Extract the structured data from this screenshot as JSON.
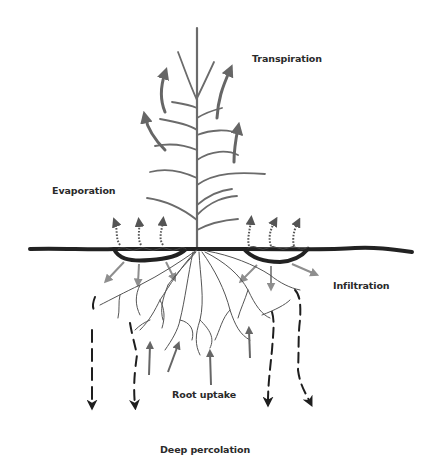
{
  "diagram": {
    "colors": {
      "stem": "#6b6b6b",
      "leaf": "#6b6b6b",
      "transpiration_arrow": "#666666",
      "evaporation_arrow": "#555555",
      "soil_surface": "#222222",
      "infiltration_arrow": "#8e8e8e",
      "root": "#555555",
      "root_uptake_arrow": "#666666",
      "percolation_arrow": "#1e1e1e",
      "label_text": "#2a2a2a"
    },
    "labels": {
      "transpiration": "Transpiration",
      "evaporation": "Evaporation",
      "infiltration": "Infiltration",
      "root_uptake": "Root uptake",
      "deep_percolation": "Deep percolation"
    },
    "processes": [
      {
        "name": "Transpiration",
        "direction": "up",
        "arrow_count": 4,
        "style": "solid curved gray arrows from leaves"
      },
      {
        "name": "Evaporation",
        "direction": "up",
        "arrow_count": 6,
        "style": "dotted arrows from soil surface depressions"
      },
      {
        "name": "Infiltration",
        "direction": "down/outward",
        "arrow_count": 6,
        "style": "light gray arrows from surface depressions"
      },
      {
        "name": "Root uptake",
        "direction": "up",
        "arrow_count": 5,
        "style": "solid gray arrows into roots"
      },
      {
        "name": "Deep percolation",
        "direction": "down",
        "arrow_count": 4,
        "style": "dashed black arrows"
      }
    ]
  }
}
